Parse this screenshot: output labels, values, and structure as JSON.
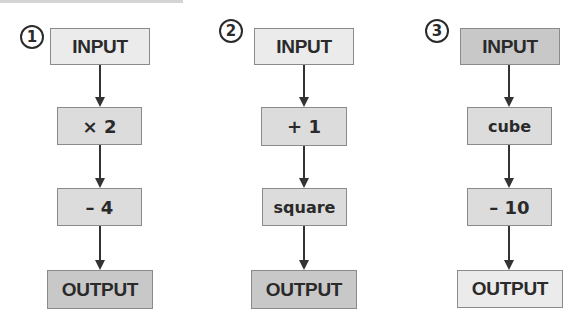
{
  "colors": {
    "light_fill": "#ebebeb",
    "medium_fill": "#dcdcdc",
    "dark_fill": "#c8c8c8",
    "border": "#8a8a8a",
    "text": "#2a2a2a",
    "arrow": "#333333"
  },
  "machines": [
    {
      "number": "1",
      "steps": [
        {
          "label": "INPUT",
          "kind": "io",
          "fill": "light"
        },
        {
          "label": "× 2",
          "kind": "op",
          "fill": "medium"
        },
        {
          "label": "– 4",
          "kind": "op",
          "fill": "medium"
        },
        {
          "label": "OUTPUT",
          "kind": "io",
          "fill": "dark"
        }
      ]
    },
    {
      "number": "2",
      "steps": [
        {
          "label": "INPUT",
          "kind": "io",
          "fill": "light"
        },
        {
          "label": "+ 1",
          "kind": "op",
          "fill": "medium"
        },
        {
          "label": "square",
          "kind": "op",
          "fill": "medium"
        },
        {
          "label": "OUTPUT",
          "kind": "io",
          "fill": "dark"
        }
      ]
    },
    {
      "number": "3",
      "steps": [
        {
          "label": "INPUT",
          "kind": "io",
          "fill": "dark"
        },
        {
          "label": "cube",
          "kind": "op",
          "fill": "medium"
        },
        {
          "label": "– 10",
          "kind": "op",
          "fill": "medium"
        },
        {
          "label": "OUTPUT",
          "kind": "io",
          "fill": "light"
        }
      ]
    }
  ]
}
